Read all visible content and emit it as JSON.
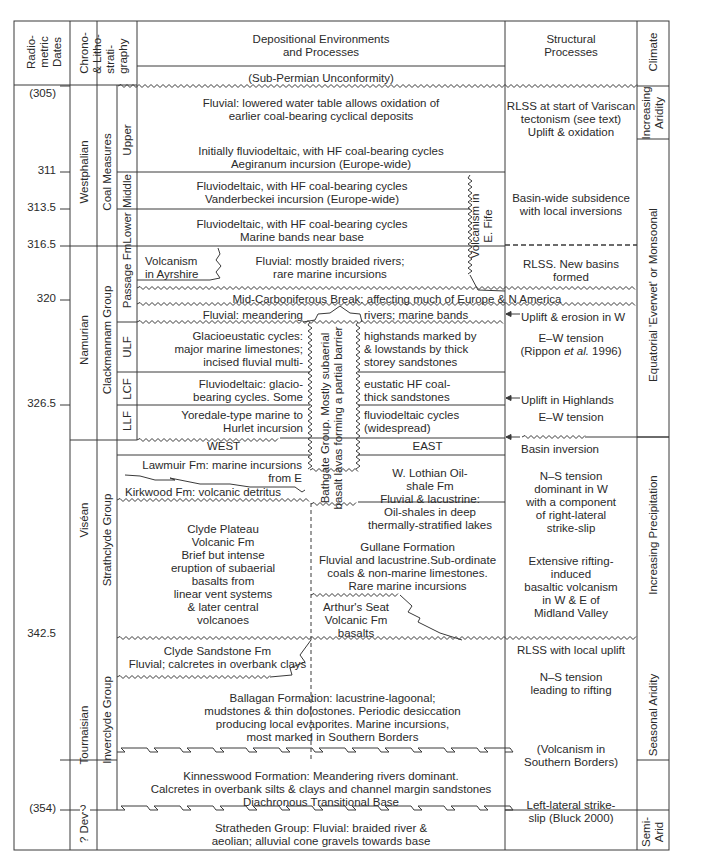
{
  "header": {
    "radiometric_dates": "Radio- metric Dates",
    "radiometric_lines": [
      "Radio-",
      "metric",
      "Dates"
    ],
    "chrono_lines": [
      "Chrono-",
      "& Litho-",
      "strati-",
      "graphy"
    ],
    "depositional": [
      "Depositional Environments",
      "and Processes"
    ],
    "structural": [
      "Structural",
      "Processes"
    ],
    "climate": "Climate",
    "sub_permian": "(Sub-Permian Unconformity)"
  },
  "dates": [
    "(305)",
    "311",
    "313.5",
    "316.5",
    "320",
    "326.5",
    "342.5",
    "(354)"
  ],
  "question_mark": "?",
  "chrono": {
    "westphalian": "Westphalian",
    "namurian": "Namurian",
    "visean": "Viséan",
    "tournaisian": "Tournaisian",
    "dev": "? Dev"
  },
  "groups": {
    "coal_measures": "Coal Measures",
    "clackmannam": "Clackmannam Group",
    "strathclyde": "Strathclyde Group",
    "inverclyde": "Inverclyde Group"
  },
  "subunits": {
    "upper": "Upper",
    "middle": "Middle",
    "lower": "Lower",
    "passage": "Passage Fm",
    "ulf": "ULF",
    "lcf": "LCF",
    "llf": "LLF"
  },
  "depositional": {
    "upper_a": [
      "Fluvial: lowered water table allows oxidation of",
      "earlier coal-bearing cyclical deposits"
    ],
    "upper_b": [
      "Initially fluviodeltaic, with HF coal-bearing cycles",
      "Aegiranum incursion (Europe-wide)"
    ],
    "middle": [
      "Fluviodeltaic, with HF coal-bearing cycles",
      "Vanderbeckei incursion (Europe-wide)"
    ],
    "lower": [
      "Fluviodeltaic, with HF coal-bearing cycles",
      "Marine bands near base"
    ],
    "volcanism_fife": [
      "Volcanism in",
      "E. Fife"
    ],
    "volcanism_ayrshire": [
      "Volcanism",
      "in Ayrshire"
    ],
    "passage": [
      "Fluvial: mostly braided rivers;",
      "rare marine incursions"
    ],
    "mid_carb_break": "Mid-Carboniferous Break: affecting much of Europe & N America",
    "meandering_left": "Fluvial: meandering",
    "meandering_right": "rivers; marine bands",
    "ulf_left": [
      "Glacioeustatic cycles:",
      "major marine limestones;",
      "incised fluvial multi-"
    ],
    "ulf_right": [
      "highstands marked by",
      "& lowstands by thick",
      "storey sandstones"
    ],
    "lcf_left": [
      "Fluviodeltaic: glacio-",
      "bearing cycles. Some"
    ],
    "lcf_right": [
      "eustatic HF coal-",
      "thick sandstones"
    ],
    "llf_left": [
      "Yoredale-type marine to",
      "Hurlet incursion"
    ],
    "llf_right": [
      "fluviodeltaic cycles",
      "(widespread)"
    ],
    "bathgate": [
      "Bathgate Group. Mostly subaerial",
      "basalt lavas forming a partial barrier"
    ],
    "west": "WEST",
    "east": "EAST",
    "lawmuir": [
      "Lawmuir Fm: marine incursions",
      "from E"
    ],
    "kirkwood": "Kirkwood Fm: volcanic detritus",
    "clyde_plateau": [
      "Clyde Plateau",
      "Volcanic Fm",
      "Brief but intense",
      "eruption of subaerial",
      "basalts from",
      "linear vent systems",
      "& later central",
      "volcanoes"
    ],
    "w_lothian": [
      "W. Lothian Oil-",
      "shale Fm",
      "Fluvial & lacustrine:",
      "Oil-shales in deep",
      "thermally-stratified lakes"
    ],
    "gullane": [
      "Gullane Formation",
      "Fluvial and lacustrine.Sub-ordinate",
      "coals & non-marine limestones.",
      "Rare marine incursions"
    ],
    "arthurs_seat": [
      "Arthur's Seat",
      "Volcanic Fm",
      "basalts"
    ],
    "clyde_sandstone": [
      "Clyde Sandstone Fm",
      "Fluvial; calcretes in overbank clays"
    ],
    "ballagan": [
      "Ballagan Formation: lacustrine-lagoonal;",
      "mudstones & thin dolostones. Periodic desiccation",
      "producing local evaporites. Marine incursions,",
      "most marked in Southern Borders"
    ],
    "kinnesswood": [
      "Kinnesswood Formation: Meandering rivers dominant.",
      "Calcretes in overbank silts & clays and channel margin sandstones"
    ],
    "diachronous": "Diachronous Transitional Base",
    "stratheden": [
      "Stratheden Group: Fluvial: braided river &",
      "aeolian; alluvial cone gravels towards base"
    ]
  },
  "structural": {
    "rlss_variscan": [
      "RLSS at start of Variscan",
      "tectonism (see text)",
      "Uplift & oxidation"
    ],
    "basin_wide": [
      "Basin-wide subsidence",
      "with local inversions"
    ],
    "rlss_new": [
      "RLSS. New basins",
      "formed"
    ],
    "uplift_erosion": "Uplift & erosion in W",
    "ew_tension_1": [
      "E–W tension",
      "(Rippon ",
      "et al.",
      " 1996)"
    ],
    "uplift_highlands": "Uplift in Highlands",
    "ew_tension_2": "E–W tension",
    "basin_inversion": "Basin inversion",
    "ns_tension": [
      "N–S tension",
      "dominant in W",
      "with a component",
      "of right-lateral",
      "strike-slip"
    ],
    "extensive_rifting": [
      "Extensive rifting-",
      "induced",
      "basaltic volcanism",
      "in W & E of",
      "Midland Valley"
    ],
    "rlss_local": "RLSS with local uplift",
    "ns_rifting": [
      "N–S tension",
      "leading to rifting"
    ],
    "volcanism_borders": [
      "(Volcanism in",
      "Southern Borders)"
    ],
    "left_lateral": [
      "Left-lateral strike-",
      "slip (Bluck 2000)"
    ]
  },
  "climate": {
    "increasing_aridity": [
      "Increasing",
      "Aridity"
    ],
    "equatorial": "Equatorial 'Everwet' or Monsoonal",
    "increasing_precipitation": "Increasing Precipitation",
    "seasonal_aridity": "Seasonal Aridity",
    "semi_arid": [
      "Semi-",
      "Arid"
    ]
  },
  "colors": {
    "line": "#3a3a3a",
    "text": "#2a2a2a",
    "background": "#ffffff"
  }
}
